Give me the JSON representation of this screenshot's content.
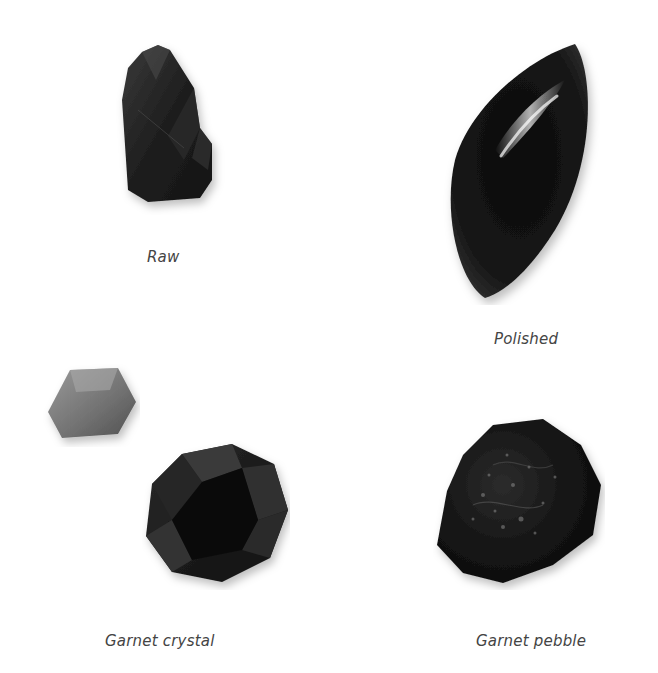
{
  "figure": {
    "specimens": [
      {
        "id": "raw",
        "caption": "Raw"
      },
      {
        "id": "polished",
        "caption": "Polished"
      },
      {
        "id": "garnet-crystal",
        "caption": "Garnet crystal"
      },
      {
        "id": "garnet-pebble",
        "caption": "Garnet pebble"
      }
    ]
  },
  "colors": {
    "background": "#ffffff",
    "stone_dark": "#141414",
    "stone_mid": "#2a2a2a",
    "stone_grey": "#7a7a7a",
    "caption": "#444444"
  }
}
